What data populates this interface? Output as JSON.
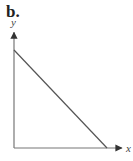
{
  "figure": {
    "panel_label": "b.",
    "x_axis_label": "x",
    "y_axis_label": "y",
    "colors": {
      "axis": "#777777",
      "line": "#555555"
    }
  },
  "chart_data": {
    "type": "line",
    "title": "b.",
    "xlabel": "x",
    "ylabel": "y",
    "series": [
      {
        "name": "line",
        "x": [
          0,
          1
        ],
        "y": [
          1,
          0
        ]
      }
    ],
    "xlim": [
      0,
      1.16
    ],
    "ylim": [
      0,
      1.18
    ],
    "grid": false,
    "ticks": "none"
  }
}
